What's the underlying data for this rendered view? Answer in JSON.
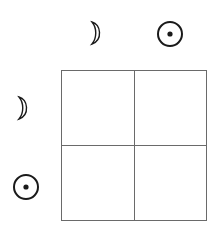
{
  "diagram": {
    "type": "2x2 grid",
    "column_headers": [
      {
        "symbol": "moon",
        "icon": "crescent-moon-icon"
      },
      {
        "symbol": "sun",
        "icon": "circled-dot-sun-icon"
      }
    ],
    "row_headers": [
      {
        "symbol": "moon",
        "icon": "crescent-moon-icon"
      },
      {
        "symbol": "sun",
        "icon": "circled-dot-sun-icon"
      }
    ],
    "cells": [
      [
        "",
        ""
      ],
      [
        "",
        ""
      ]
    ],
    "colors": {
      "line": "#6a6a6a",
      "symbol": "#1a1a1a"
    }
  }
}
